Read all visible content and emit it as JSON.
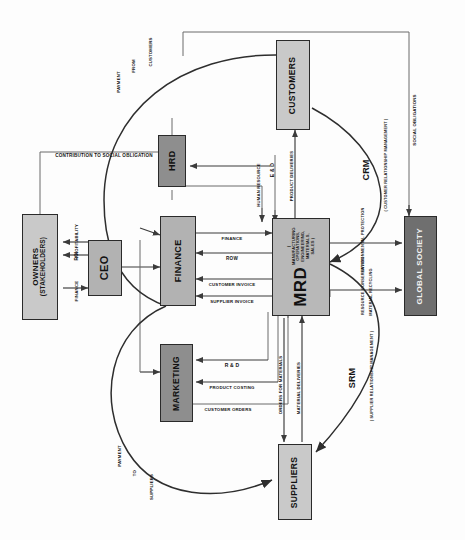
{
  "diagram": {
    "orientation": "rotated-90",
    "nodes": [
      {
        "id": "owners",
        "label": "OWNERS",
        "sublabel": "(STAKEHOLDERS)",
        "fill": "#c9c9c9"
      },
      {
        "id": "ceo",
        "label": "CEO",
        "sublabel": "",
        "fill": "#b2b2b2"
      },
      {
        "id": "hrd",
        "label": "HRD",
        "sublabel": "",
        "fill": "#8e8e8e"
      },
      {
        "id": "finance",
        "label": "FINANCE",
        "sublabel": "",
        "fill": "#b2b2b2"
      },
      {
        "id": "marketing",
        "label": "MARKETING",
        "sublabel": "",
        "fill": "#8e8e8e"
      },
      {
        "id": "mrd",
        "label": "MRD",
        "sublabel": "( MANUFACTURING OPERATIONS, ENGINEERING, MATERIALS, SALES )",
        "fill": "#b8b8b8"
      },
      {
        "id": "customers",
        "label": "CUSTOMERS",
        "sublabel": "",
        "fill": "#c9c9c9"
      },
      {
        "id": "suppliers",
        "label": "SUPPLIERS",
        "sublabel": "",
        "fill": "#c9c9c9"
      },
      {
        "id": "society",
        "label": "GLOBAL SOCIETY",
        "sublabel": "",
        "fill": "#6f6f6f"
      }
    ],
    "edge_labels": {
      "profitability": "PROFITABILITY",
      "roi_owner": "ROI",
      "finance_ceo": "FINANCE",
      "contribution": "CONTRIBUTION TO SOCIAL OBLIGATION",
      "human_resource": "HUMAN RESOURCE",
      "e_and_d": "E & D",
      "product_deliveries": "PRODUCT DELIVERIES",
      "finance_mrd": "FINANCE",
      "row": "ROW",
      "customer_invoice": "CUSTOMER INVOICE",
      "supplier_invoice": "SUPPLIER INVOICE",
      "rnd": "R & D",
      "product_costing": "PRODUCT COSTING",
      "customer_orders": "CUSTOMER ORDERS",
      "orders_for_materials": "ORDERS FOR MATERIALS",
      "material_deliveries": "MATERIAL DELIVERIES",
      "environmental_protection": "ENVIRONMENTAL PROTECTION",
      "resource_conservation": "RESOURCE CONSERVATION",
      "material_recycling": "MATERIAL RECYCLING",
      "social_obligations": "SOCIAL OBLIGATIONS"
    },
    "curve_labels": {
      "payment_from_customers": [
        "PAYMENT",
        "FROM",
        "CUSTOMERS"
      ],
      "payment_to_suppliers": [
        "PAYMENT",
        "TO",
        "SUPPLIERS"
      ],
      "crm": "CRM",
      "crm_full": "( CUSTOMER RELATIONSHIP MANAGEMENT )",
      "srm": "SRM",
      "srm_full": "( SUPPLIER RELATIONSHIP MANAGEMENT )"
    },
    "colors": {
      "line": "#3b3b3b",
      "border": "#2a2a2a",
      "text": "#141414",
      "background": "#fdfdfd"
    }
  }
}
